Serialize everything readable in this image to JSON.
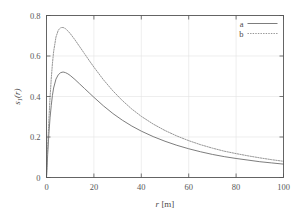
{
  "chart_data": {
    "type": "line",
    "title": "",
    "subtitle": "",
    "xlabel": "r [m]",
    "ylabel": "s1(r)",
    "ylabel_base": "s",
    "ylabel_sub": "1",
    "ylabel_tail": "(r)",
    "xlabel_var": "r",
    "xlabel_unit": "[m]",
    "xlim": [
      0,
      100
    ],
    "ylim": [
      0,
      0.8
    ],
    "xticks": [
      0,
      20,
      40,
      60,
      80,
      100
    ],
    "xtick_labels": [
      "0",
      "20",
      "40",
      "60",
      "80",
      "100"
    ],
    "yticks": [
      0,
      0.2,
      0.4,
      0.6,
      0.8
    ],
    "ytick_labels": [
      "0",
      "0.2",
      "0.4",
      "0.6",
      "0.8"
    ],
    "grid": true,
    "grid_color": "#e2e2e2",
    "frame_color": "#555555",
    "legend_position": "top-right-inside",
    "legend": [
      {
        "name": "a",
        "style": "solid",
        "color": "#6e6e6e"
      },
      {
        "name": "b",
        "style": "dotted",
        "color": "#8a8a8a"
      }
    ],
    "series": [
      {
        "name": "a",
        "style": "solid",
        "color": "#6e6e6e",
        "peak_x": 7,
        "peak_y": 0.52,
        "x": [
          0,
          0.5,
          1,
          1.5,
          2,
          2.5,
          3,
          4,
          5,
          6,
          7,
          8,
          9,
          10,
          12,
          14,
          16,
          18,
          20,
          24,
          28,
          32,
          36,
          40,
          45,
          50,
          55,
          60,
          65,
          70,
          75,
          80,
          85,
          90,
          95,
          100
        ],
        "values": [
          0,
          0.115,
          0.215,
          0.295,
          0.355,
          0.405,
          0.442,
          0.486,
          0.508,
          0.518,
          0.521,
          0.518,
          0.512,
          0.504,
          0.484,
          0.462,
          0.44,
          0.418,
          0.396,
          0.354,
          0.316,
          0.283,
          0.254,
          0.229,
          0.202,
          0.179,
          0.159,
          0.142,
          0.127,
          0.114,
          0.103,
          0.094,
          0.086,
          0.078,
          0.072,
          0.066
        ]
      },
      {
        "name": "b",
        "style": "dotted",
        "color": "#8a8a8a",
        "peak_x": 7,
        "peak_y": 0.74,
        "x": [
          0,
          0.5,
          1,
          1.5,
          2,
          2.5,
          3,
          4,
          5,
          6,
          7,
          8,
          9,
          10,
          12,
          14,
          16,
          18,
          20,
          24,
          28,
          32,
          36,
          40,
          45,
          50,
          55,
          60,
          65,
          70,
          75,
          80,
          85,
          90,
          95,
          100
        ],
        "values": [
          0,
          0.15,
          0.282,
          0.395,
          0.487,
          0.562,
          0.621,
          0.694,
          0.728,
          0.74,
          0.741,
          0.735,
          0.724,
          0.711,
          0.68,
          0.646,
          0.612,
          0.578,
          0.545,
          0.483,
          0.428,
          0.38,
          0.338,
          0.302,
          0.264,
          0.232,
          0.205,
          0.182,
          0.162,
          0.145,
          0.13,
          0.118,
          0.107,
          0.097,
          0.088,
          0.08
        ]
      }
    ]
  }
}
